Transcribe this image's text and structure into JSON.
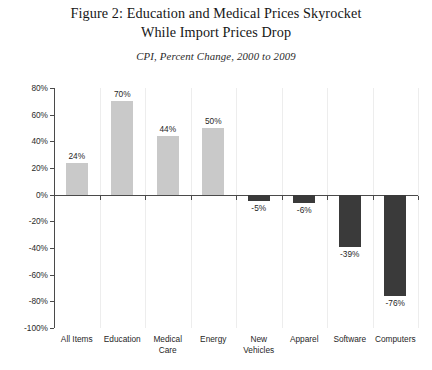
{
  "figure": {
    "title_lines": [
      "Figure 2: Education and Medical Prices Skyrocket",
      "While Import Prices Drop"
    ],
    "subtitle": "CPI, Percent Change, 2000 to 2009"
  },
  "colors": {
    "positive_bar": "#c9c9c9",
    "negative_bar": "#3a3a3a",
    "axis": "#4a4a4a",
    "gridline": "#ededed",
    "background": "#ffffff",
    "text": "#1f1f1f"
  },
  "chart_data": {
    "type": "bar",
    "title": "Figure 2: Education and Medical Prices Skyrocket While Import Prices Drop",
    "subtitle": "CPI, Percent Change, 2000 to 2009",
    "xlabel": "",
    "ylabel": "",
    "ylim": [
      -100,
      80
    ],
    "ytick_values": [
      80,
      60,
      40,
      20,
      0,
      -20,
      -40,
      -60,
      -80,
      -100
    ],
    "ytick_labels": [
      "80%",
      "60%",
      "40%",
      "20%",
      "0%",
      "-20%",
      "-40%",
      "-60%",
      "-80%",
      "-100%"
    ],
    "grid": "vertical-category-separators",
    "legend": "none",
    "categories": [
      "All Items",
      "Education",
      "Medical\nCare",
      "Energy",
      "New\nVehicles",
      "Apparel",
      "Software",
      "Computers"
    ],
    "values": [
      24,
      70,
      44,
      50,
      -5,
      -6,
      -39,
      -76
    ],
    "data_labels": [
      "24%",
      "70%",
      "44%",
      "50%",
      "-5%",
      "-6%",
      "-39%",
      "-76%"
    ]
  }
}
